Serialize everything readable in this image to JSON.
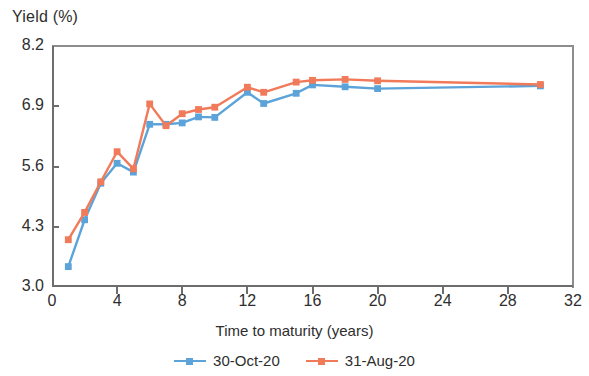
{
  "chart_data": {
    "type": "line",
    "title": "",
    "subtitle": "",
    "ylabel": "Yield (%)",
    "xlabel": "Time to maturity (years)",
    "xlim": [
      0,
      32
    ],
    "ylim": [
      3.0,
      8.2
    ],
    "xticks": [
      0,
      4,
      8,
      12,
      16,
      20,
      24,
      28,
      32
    ],
    "yticks": [
      3.0,
      4.3,
      5.6,
      6.9,
      8.2
    ],
    "xtick_labels": [
      "0",
      "4",
      "8",
      "12",
      "16",
      "20",
      "24",
      "28",
      "32"
    ],
    "ytick_labels": [
      "3.0",
      "4.3",
      "5.6",
      "6.9",
      "8.2"
    ],
    "grid": false,
    "legend_position": "bottom",
    "markers": "square",
    "series": [
      {
        "name": "30-Oct-20",
        "color": "#5BA3D9",
        "x": [
          1,
          2,
          3,
          4,
          5,
          6,
          7,
          8,
          9,
          10,
          12,
          13,
          15,
          16,
          18,
          20,
          30
        ],
        "values": [
          3.44,
          4.45,
          5.24,
          5.67,
          5.48,
          6.51,
          6.51,
          6.54,
          6.67,
          6.66,
          7.2,
          6.96,
          7.18,
          7.36,
          7.32,
          7.28,
          7.34
        ]
      },
      {
        "name": "31-Aug-20",
        "color": "#F07A5A",
        "x": [
          1,
          2,
          3,
          4,
          5,
          6,
          7,
          8,
          9,
          10,
          12,
          13,
          15,
          16,
          18,
          20,
          30
        ],
        "values": [
          4.02,
          4.61,
          5.27,
          5.92,
          5.55,
          6.95,
          6.48,
          6.74,
          6.83,
          6.88,
          7.31,
          7.2,
          7.42,
          7.46,
          7.48,
          7.45,
          7.37
        ]
      }
    ]
  },
  "legend": {
    "items": [
      {
        "label": "30-Oct-20",
        "color": "#5BA3D9"
      },
      {
        "label": "31-Aug-20",
        "color": "#F07A5A"
      }
    ]
  }
}
